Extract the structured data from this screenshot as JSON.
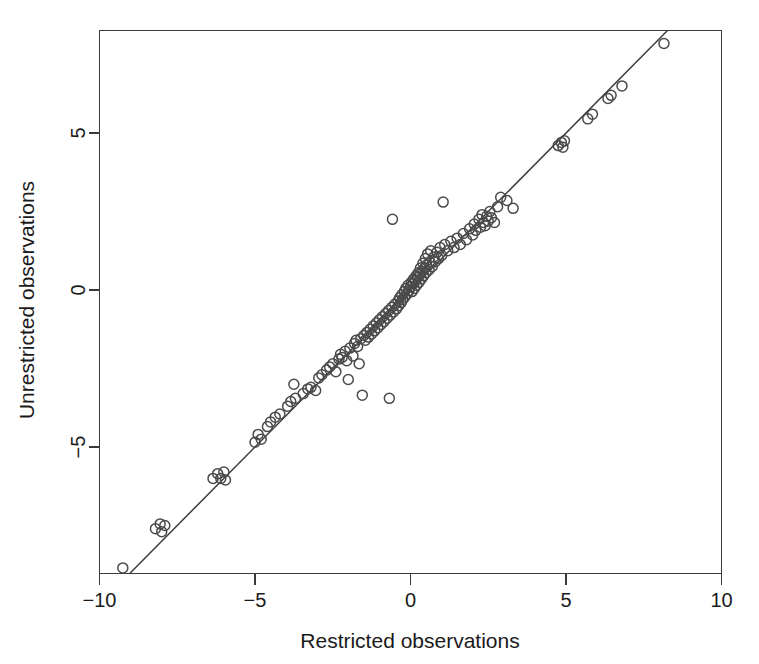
{
  "chart_data": {
    "type": "scatter",
    "title": "",
    "xlabel": "Restricted observations",
    "ylabel": "Unrestricted observations",
    "xlim": [
      -10,
      10
    ],
    "ylim": [
      -9.3,
      9.3
    ],
    "grid": false,
    "legend": null,
    "xticks": [
      -10,
      -5,
      0,
      5,
      10
    ],
    "xtick_labels": [
      "-10",
      "-5",
      "0",
      "5",
      "10"
    ],
    "yticks": [
      -5,
      0,
      5
    ],
    "ytick_labels": [
      "-5",
      "0",
      "5"
    ],
    "marker": "open-circle",
    "marker_size": 10,
    "point_color": "#4a4a4a",
    "line_color": "#3d3d3d",
    "reference_line": {
      "type": "identity",
      "slope": 1,
      "intercept": 0,
      "label": "y = x"
    },
    "n_points": 146,
    "points": [
      [
        -9.25,
        -8.85
      ],
      [
        -8.2,
        -7.6
      ],
      [
        -8.05,
        -7.45
      ],
      [
        -8.0,
        -7.7
      ],
      [
        -7.9,
        -7.5
      ],
      [
        -6.35,
        -6.0
      ],
      [
        -6.2,
        -5.85
      ],
      [
        -6.1,
        -6.0
      ],
      [
        -6.0,
        -5.8
      ],
      [
        -5.95,
        -6.05
      ],
      [
        -5.0,
        -4.85
      ],
      [
        -4.9,
        -4.6
      ],
      [
        -4.8,
        -4.75
      ],
      [
        -4.6,
        -4.35
      ],
      [
        -4.5,
        -4.2
      ],
      [
        -4.35,
        -4.05
      ],
      [
        -4.2,
        -3.95
      ],
      [
        -3.95,
        -3.7
      ],
      [
        -3.85,
        -3.55
      ],
      [
        -3.75,
        -3.0
      ],
      [
        -3.7,
        -3.45
      ],
      [
        -3.45,
        -3.3
      ],
      [
        -3.3,
        -3.15
      ],
      [
        -3.2,
        -3.1
      ],
      [
        -3.05,
        -3.2
      ],
      [
        -2.95,
        -2.8
      ],
      [
        -2.85,
        -2.7
      ],
      [
        -2.7,
        -2.55
      ],
      [
        -2.6,
        -2.45
      ],
      [
        -2.5,
        -2.35
      ],
      [
        -2.4,
        -2.6
      ],
      [
        -2.3,
        -2.2
      ],
      [
        -2.25,
        -2.05
      ],
      [
        -2.2,
        -2.15
      ],
      [
        -2.1,
        -1.95
      ],
      [
        -2.05,
        -2.25
      ],
      [
        -2.0,
        -2.85
      ],
      [
        -1.95,
        -1.85
      ],
      [
        -1.85,
        -2.1
      ],
      [
        -1.8,
        -1.7
      ],
      [
        -1.75,
        -1.6
      ],
      [
        -1.7,
        -1.8
      ],
      [
        -1.65,
        -2.35
      ],
      [
        -1.6,
        -1.55
      ],
      [
        -1.55,
        -3.35
      ],
      [
        -1.5,
        -1.45
      ],
      [
        -1.45,
        -1.6
      ],
      [
        -1.4,
        -1.35
      ],
      [
        -1.35,
        -1.5
      ],
      [
        -1.3,
        -1.25
      ],
      [
        -1.25,
        -1.4
      ],
      [
        -1.2,
        -1.15
      ],
      [
        -1.15,
        -1.3
      ],
      [
        -1.1,
        -1.05
      ],
      [
        -1.05,
        -1.2
      ],
      [
        -1.0,
        -0.95
      ],
      [
        -0.95,
        -1.1
      ],
      [
        -0.9,
        -0.85
      ],
      [
        -0.85,
        -1.0
      ],
      [
        -0.8,
        -0.75
      ],
      [
        -0.75,
        -0.9
      ],
      [
        -0.7,
        -0.65
      ],
      [
        -0.68,
        -3.45
      ],
      [
        -0.65,
        -0.8
      ],
      [
        -0.6,
        -0.55
      ],
      [
        -0.58,
        2.25
      ],
      [
        -0.55,
        -0.7
      ],
      [
        -0.5,
        -0.45
      ],
      [
        -0.45,
        -0.6
      ],
      [
        -0.4,
        -0.35
      ],
      [
        -0.38,
        -0.5
      ],
      [
        -0.35,
        -0.25
      ],
      [
        -0.3,
        -0.4
      ],
      [
        -0.28,
        -0.15
      ],
      [
        -0.25,
        -0.3
      ],
      [
        -0.2,
        -0.05
      ],
      [
        -0.18,
        -0.22
      ],
      [
        -0.15,
        0.05
      ],
      [
        -0.1,
        -0.12
      ],
      [
        -0.08,
        0.15
      ],
      [
        -0.05,
        -0.02
      ],
      [
        0.0,
        0.1
      ],
      [
        0.03,
        0.25
      ],
      [
        0.05,
        -0.05
      ],
      [
        0.08,
        0.2
      ],
      [
        0.1,
        0.35
      ],
      [
        0.12,
        0.05
      ],
      [
        0.15,
        0.3
      ],
      [
        0.18,
        0.45
      ],
      [
        0.2,
        0.15
      ],
      [
        0.22,
        0.4
      ],
      [
        0.25,
        0.55
      ],
      [
        0.28,
        0.25
      ],
      [
        0.3,
        0.5
      ],
      [
        0.32,
        0.7
      ],
      [
        0.35,
        0.35
      ],
      [
        0.38,
        0.6
      ],
      [
        0.4,
        0.85
      ],
      [
        0.42,
        0.45
      ],
      [
        0.45,
        0.7
      ],
      [
        0.48,
        1.0
      ],
      [
        0.5,
        0.55
      ],
      [
        0.52,
        0.8
      ],
      [
        0.55,
        1.15
      ],
      [
        0.6,
        0.65
      ],
      [
        0.62,
        0.9
      ],
      [
        0.65,
        1.25
      ],
      [
        0.7,
        0.75
      ],
      [
        0.75,
        1.05
      ],
      [
        0.8,
        0.9
      ],
      [
        0.85,
        1.2
      ],
      [
        0.9,
        1.0
      ],
      [
        0.95,
        1.35
      ],
      [
        1.0,
        1.1
      ],
      [
        1.05,
        2.8
      ],
      [
        1.1,
        1.45
      ],
      [
        1.2,
        1.25
      ],
      [
        1.3,
        1.55
      ],
      [
        1.4,
        1.35
      ],
      [
        1.5,
        1.65
      ],
      [
        1.6,
        1.45
      ],
      [
        1.7,
        1.8
      ],
      [
        1.8,
        1.6
      ],
      [
        1.9,
        1.95
      ],
      [
        2.0,
        1.75
      ],
      [
        2.05,
        2.1
      ],
      [
        2.1,
        1.9
      ],
      [
        2.2,
        2.25
      ],
      [
        2.25,
        2.0
      ],
      [
        2.3,
        2.4
      ],
      [
        2.35,
        2.15
      ],
      [
        2.4,
        2.05
      ],
      [
        2.45,
        2.35
      ],
      [
        2.5,
        2.2
      ],
      [
        2.55,
        2.5
      ],
      [
        2.6,
        2.3
      ],
      [
        2.7,
        2.15
      ],
      [
        2.8,
        2.65
      ],
      [
        2.9,
        2.95
      ],
      [
        3.1,
        2.85
      ],
      [
        3.3,
        2.6
      ],
      [
        4.75,
        4.6
      ],
      [
        4.85,
        4.7
      ],
      [
        4.9,
        4.55
      ],
      [
        4.95,
        4.75
      ],
      [
        5.7,
        5.45
      ],
      [
        5.85,
        5.6
      ],
      [
        6.35,
        6.1
      ],
      [
        6.45,
        6.2
      ],
      [
        6.8,
        6.5
      ],
      [
        8.15,
        7.85
      ],
      [
        8.95,
        8.6
      ],
      [
        9.3,
        8.95
      ]
    ]
  },
  "axis": {
    "x_title": "Restricted observations",
    "y_title": "Unrestricted observations"
  }
}
